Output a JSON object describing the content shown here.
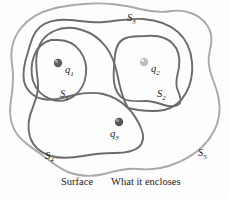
{
  "figure": {
    "background_color": "#fdfdfd",
    "surfaces": [
      {
        "id": "S1",
        "label": "S",
        "subscript": "1",
        "label_x": 60,
        "label_y": 96,
        "color": "#6b6b6b",
        "stroke_width": 1.9,
        "encloses": [
          "q1"
        ]
      },
      {
        "id": "S2",
        "label": "S",
        "subscript": "2",
        "label_x": 157,
        "label_y": 96,
        "color": "#6b6b6b",
        "stroke_width": 1.9,
        "encloses": [
          "q2"
        ]
      },
      {
        "id": "S3",
        "label": "S",
        "subscript": "3",
        "label_x": 127,
        "label_y": 20,
        "color": "#6b6b6b",
        "stroke_width": 1.9,
        "encloses": [
          "q1",
          "q2"
        ]
      },
      {
        "id": "S4",
        "label": "S",
        "subscript": "4",
        "label_x": 45,
        "label_y": 158,
        "color": "#6b6b6b",
        "stroke_width": 1.9,
        "encloses": [
          "q1",
          "q3"
        ]
      },
      {
        "id": "S5",
        "label": "S",
        "subscript": "5",
        "label_x": 198,
        "label_y": 155,
        "color": "#a9a9a9",
        "stroke_width": 1.9,
        "encloses": [
          "q1",
          "q2",
          "q3"
        ]
      }
    ],
    "charges": [
      {
        "id": "q1",
        "label": "q",
        "subscript": "1",
        "cx": 58,
        "cy": 63,
        "r": 4.2,
        "fill": "#5c5c5c",
        "highlight": "#b4b4b4",
        "label_x": 65,
        "label_y": 72
      },
      {
        "id": "q2",
        "label": "q",
        "subscript": "2",
        "cx": 144,
        "cy": 62,
        "r": 4.2,
        "fill": "#b9b9b9",
        "highlight": "#e2e2e2",
        "label_x": 151,
        "label_y": 71
      },
      {
        "id": "q3",
        "label": "q",
        "subscript": "3",
        "cx": 119,
        "cy": 122,
        "r": 4.2,
        "fill": "#555555",
        "highlight": "#adadad",
        "label_x": 110,
        "label_y": 136
      }
    ]
  },
  "caption": {
    "surface_column": "Surface",
    "encloses_column": "What it encloses"
  }
}
